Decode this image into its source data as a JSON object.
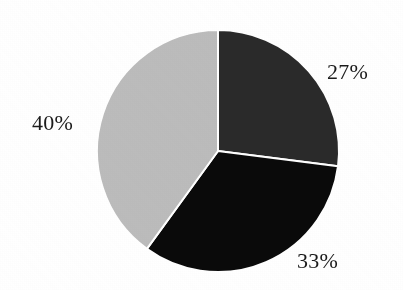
{
  "figure": {
    "title": "",
    "background_color": "#ffffff"
  },
  "chart_data": {
    "type": "pie",
    "title": "",
    "xlabel": "",
    "ylabel": "",
    "categories": [
      "Segment 1",
      "Segment 2",
      "Segment 3"
    ],
    "values": [
      27,
      33,
      40
    ],
    "unit": "%",
    "labels": [
      "27%",
      "33%",
      "40%"
    ],
    "colors": [
      "#2a2a2a",
      "#0a0a0a",
      "#bcbcbc"
    ],
    "start_angle_deg": 0,
    "direction": "clockwise",
    "legend": "none",
    "grid": false,
    "slices": [
      {
        "name": "Segment 1",
        "value": 27,
        "label": "27%",
        "color": "#2a2a2a",
        "start_angle_deg": 0,
        "end_angle_deg": 97.2,
        "label_position": "right-upper"
      },
      {
        "name": "Segment 2",
        "value": 33,
        "label": "33%",
        "color": "#0a0a0a",
        "start_angle_deg": 97.2,
        "end_angle_deg": 216.0,
        "label_position": "bottom-right"
      },
      {
        "name": "Segment 3",
        "value": 40,
        "label": "40%",
        "color": "#bcbcbc",
        "start_angle_deg": 216.0,
        "end_angle_deg": 360.0,
        "label_position": "left"
      }
    ],
    "geometry": {
      "center_x": 218,
      "center_y": 151,
      "radius": 121,
      "separator_color": "#ffffff",
      "separator_width": 2
    }
  }
}
